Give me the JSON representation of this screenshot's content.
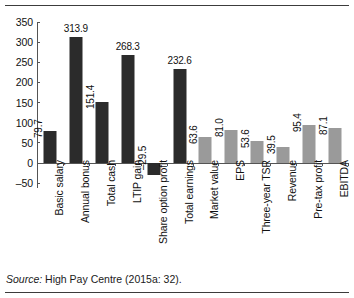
{
  "figure": {
    "source_label": "Source:",
    "source_text": "High Pay Centre (2015a: 32)."
  },
  "chart_data": {
    "type": "bar",
    "title": "",
    "xlabel": "",
    "ylabel": "",
    "ylim": [
      -50,
      350
    ],
    "yticks": [
      350,
      300,
      250,
      200,
      150,
      100,
      50,
      0,
      -50
    ],
    "ytick_labels": [
      "350",
      "300",
      "250",
      "200",
      "150",
      "100",
      "50",
      "0",
      "–50"
    ],
    "grid": false,
    "legend": "none",
    "categories": [
      "Basic salary",
      "Annual bonus",
      "Total cash",
      "LTIP gain",
      "Share option profit",
      "Total earnings",
      "Market value",
      "EPS",
      "Three-year TSR",
      "Revenue",
      "Pre-tax profit",
      "EBITDA"
    ],
    "values": [
      79.7,
      313.9,
      151.4,
      268.3,
      -29.5,
      232.6,
      63.6,
      81.0,
      53.6,
      39.5,
      95.4,
      87.1
    ],
    "value_labels": [
      "79.7",
      "313.9",
      "151.4",
      "268.3",
      "–29.5",
      "232.6",
      "63.6",
      "81.0",
      "53.6",
      "39.5",
      "95.4",
      "87.1"
    ],
    "label_orientation": [
      "rotated",
      "horizontal",
      "rotated",
      "horizontal",
      "rotated",
      "horizontal",
      "rotated",
      "rotated",
      "rotated",
      "rotated",
      "rotated",
      "rotated"
    ],
    "series_groups": [
      {
        "name": "Pay measures",
        "color": "#2b2b2b",
        "indices": [
          0,
          1,
          2,
          3,
          4,
          5
        ]
      },
      {
        "name": "Company performance measures",
        "color": "#9a9a9a",
        "indices": [
          6,
          7,
          8,
          9,
          10,
          11
        ]
      }
    ],
    "colors": {
      "dark": "#2b2b2b",
      "gray": "#9a9a9a",
      "axis": "#545454"
    }
  }
}
